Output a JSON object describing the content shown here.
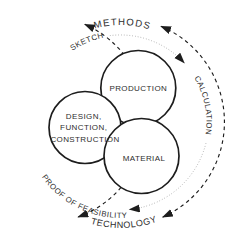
{
  "diagram": {
    "outer_cycle": {
      "top_label": "METHODS",
      "bottom_label": "TECHNOLOGY"
    },
    "process_steps": {
      "sketch": "SKETCH",
      "calculation": "CALCULATION",
      "proof": "PROOF OF FEASIBILITY"
    },
    "circles": {
      "production": {
        "label": "PRODUCTION"
      },
      "design": {
        "lines": [
          "DESIGN,",
          "FUNCTION,",
          "CONSTRUCTION"
        ]
      },
      "material": {
        "label": "MATERIAL"
      }
    },
    "colors": {
      "line_dark": "#1d1d1d",
      "line_dotted": "#9a9a9a",
      "text": "#2e2e2e",
      "background": "#ffffff"
    }
  }
}
